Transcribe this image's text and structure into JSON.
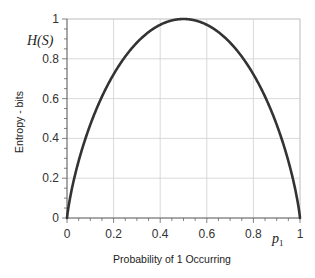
{
  "chart_data": {
    "type": "line",
    "title": "",
    "xlabel": "Probability of 1 Occurring",
    "ylabel": "Entropy - bits",
    "x_annotation": "p",
    "x_annotation_sub": "1",
    "y_annotation": "H(S)",
    "xlim": [
      0,
      1
    ],
    "ylim": [
      0,
      1
    ],
    "x_ticks": [
      0,
      0.2,
      0.4,
      0.6,
      0.8,
      1
    ],
    "x_tick_labels": [
      "0",
      "0.2",
      "0.4",
      "0.6",
      "0.8",
      "1"
    ],
    "y_ticks": [
      0,
      0.2,
      0.4,
      0.6,
      0.8,
      1
    ],
    "y_tick_labels": [
      "0",
      "0.2",
      "0.4",
      "0.6",
      "0.8",
      "1"
    ],
    "minor_tick_step": 0.05,
    "grid": true,
    "legend": null,
    "series": [
      {
        "name": "H(S) = -p log2 p - (1-p) log2 (1-p)",
        "x": [
          0,
          0.01,
          0.05,
          0.1,
          0.2,
          0.3,
          0.4,
          0.5,
          0.6,
          0.7,
          0.8,
          0.9,
          0.95,
          0.99,
          1
        ],
        "values": [
          0,
          0.081,
          0.286,
          0.469,
          0.722,
          0.881,
          0.971,
          1.0,
          0.971,
          0.881,
          0.722,
          0.469,
          0.286,
          0.081,
          0
        ],
        "color": "#333333"
      }
    ]
  },
  "colors": {
    "curve": "#333333",
    "grid": "#cfcfcf",
    "frame": "#c8c8c8",
    "axis": "#666666"
  }
}
